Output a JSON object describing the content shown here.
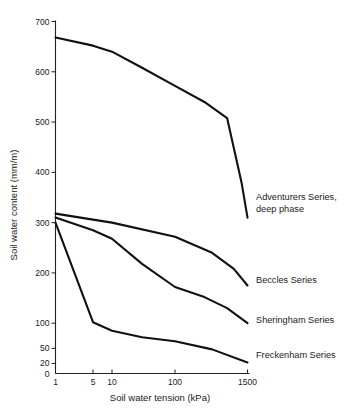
{
  "chart_data": {
    "type": "line",
    "title": "",
    "xlabel": "Soil water tension (kPa)",
    "ylabel": "Soil water content (mm/m)",
    "x_scale": "log-irregular",
    "x_ticks": [
      "1",
      "5",
      "10",
      "100",
      "1500"
    ],
    "x_tick_values": [
      1,
      5,
      10,
      100,
      1500
    ],
    "y_ticks": [
      "0",
      "20",
      "50",
      "100",
      "200",
      "300",
      "400",
      "500",
      "600",
      "700"
    ],
    "y_tick_values": [
      0,
      20,
      50,
      100,
      200,
      300,
      400,
      500,
      600,
      700
    ],
    "ylim": [
      0,
      700
    ],
    "grid": false,
    "legend_position": "right-inline-labels",
    "series": [
      {
        "name": "Adventurers Series, deep phase",
        "label_line_1": "Adventurers Series,",
        "label_line_2": "deep phase",
        "x": [
          1,
          5,
          10,
          30,
          100,
          300,
          700,
          1200,
          1500
        ],
        "values": [
          668,
          652,
          640,
          608,
          572,
          540,
          508,
          380,
          310
        ]
      },
      {
        "name": "Beccles Series",
        "label_line_1": "Beccles Series",
        "label_line_2": "",
        "x": [
          1,
          5,
          10,
          100,
          400,
          900,
          1500
        ],
        "values": [
          318,
          306,
          300,
          272,
          240,
          208,
          175
        ]
      },
      {
        "name": "Sheringham Series",
        "label_line_1": "Sheringham Series",
        "label_line_2": "",
        "x": [
          1,
          5,
          10,
          30,
          100,
          300,
          700,
          1500
        ],
        "values": [
          310,
          285,
          268,
          218,
          172,
          152,
          130,
          100
        ]
      },
      {
        "name": "Freckenham Series",
        "label_line_1": "Freckenham Series",
        "label_line_2": "",
        "x": [
          1,
          5,
          10,
          30,
          100,
          400,
          1500
        ],
        "values": [
          300,
          102,
          85,
          72,
          64,
          48,
          22
        ]
      }
    ]
  }
}
